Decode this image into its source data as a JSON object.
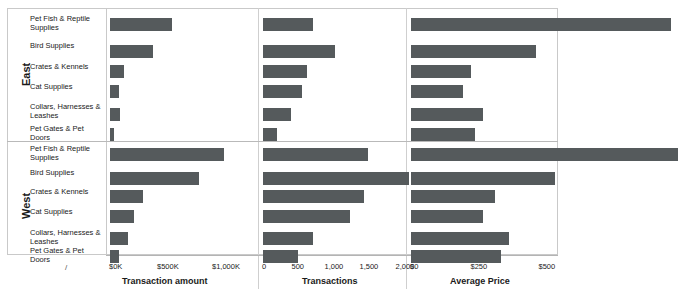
{
  "chart_data": {
    "type": "bar",
    "orientation": "horizontal",
    "title": "",
    "grid": false,
    "legend": null,
    "row_groups": [
      "East",
      "West"
    ],
    "categories": [
      "Pet Fish & Reptile Supplies",
      "Bird Supplies",
      "Crates & Kennels",
      "Cat Supplies",
      "Collars, Harnesses & Leashes",
      "Pet Gates & Pet Doors"
    ],
    "panels": [
      {
        "name": "transaction-amount",
        "xlabel": "Transaction amount",
        "ticks": [
          "$0K",
          "$500K",
          "$1,000K"
        ],
        "tick_values": [
          0,
          500000,
          1000000
        ],
        "xlim": [
          0,
          1100000
        ],
        "series": [
          {
            "name": "East",
            "values": [
              540000,
              375000,
              118000,
              82000,
              88000,
              36000
            ]
          },
          {
            "name": "West",
            "values": [
              995000,
              775000,
              288000,
              205000,
              160000,
              78000
            ]
          }
        ]
      },
      {
        "name": "transactions",
        "xlabel": "Transactions",
        "ticks": [
          "0",
          "500",
          "1,000",
          "1,500",
          "2,000"
        ],
        "tick_values": [
          0,
          500,
          1000,
          1500,
          2000
        ],
        "xlim": [
          0,
          2100
        ],
        "series": [
          {
            "name": "East",
            "values": [
              700,
              1010,
              620,
              550,
              400,
              200
            ]
          },
          {
            "name": "West",
            "values": [
              1480,
              2060,
              1420,
              1230,
              700,
              490
            ]
          }
        ]
      },
      {
        "name": "average-price",
        "xlabel": "Average Price",
        "ticks": [
          "$0",
          "$250",
          "$500"
        ],
        "tick_values": [
          0,
          250,
          500
        ],
        "xlim": [
          0,
          545
        ],
        "series": [
          {
            "name": "East",
            "values": [
              478,
              230,
              110,
              95,
              133,
              118
            ]
          },
          {
            "name": "West",
            "values": [
              490,
              265,
              155,
              133,
              180,
              165
            ]
          }
        ]
      }
    ],
    "colors": {
      "bar": "#555a5c",
      "frame": "#c9c9c9",
      "background": "#ffffff"
    }
  },
  "marks": {
    "corner_slash": "/"
  }
}
